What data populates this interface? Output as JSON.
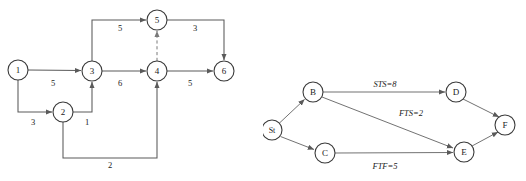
{
  "figures": [
    {
      "id": "activity-on-arrow-network",
      "name": "Activity-on-arrow network diagram",
      "nodes": [
        {
          "id": "n1",
          "label": "1",
          "cx": 18,
          "cy": 70,
          "r": 10
        },
        {
          "id": "n2",
          "label": "2",
          "cx": 63,
          "cy": 112,
          "r": 10
        },
        {
          "id": "n3",
          "label": "3",
          "cx": 92,
          "cy": 71,
          "r": 10
        },
        {
          "id": "n4",
          "label": "4",
          "cx": 157,
          "cy": 71,
          "r": 10
        },
        {
          "id": "n5",
          "label": "5",
          "cx": 157,
          "cy": 20,
          "r": 10
        },
        {
          "id": "n6",
          "label": "6",
          "cx": 224,
          "cy": 71,
          "r": 10
        }
      ],
      "edges": [
        {
          "from": "1",
          "to": "3",
          "weight": "5",
          "style": "solid",
          "label_x": 53,
          "label_y": 83
        },
        {
          "from": "1",
          "to": "2",
          "weight": "3",
          "style": "solid",
          "label_x": 33,
          "label_y": 122
        },
        {
          "from": "2",
          "to": "3",
          "weight": "1",
          "style": "solid",
          "label_x": 87,
          "label_y": 122
        },
        {
          "from": "3",
          "to": "4",
          "weight": "6",
          "style": "solid",
          "label_x": 120,
          "label_y": 83
        },
        {
          "from": "3",
          "to": "5",
          "weight": "5",
          "style": "solid",
          "label_x": 120,
          "label_y": 28
        },
        {
          "from": "2",
          "to": "4",
          "weight": "2",
          "style": "solid",
          "label_x": 110,
          "label_y": 165
        },
        {
          "from": "4",
          "to": "5",
          "weight": "",
          "style": "dashed",
          "label_x": 0,
          "label_y": 0
        },
        {
          "from": "4",
          "to": "6",
          "weight": "5",
          "style": "solid",
          "label_x": 190,
          "label_y": 83
        },
        {
          "from": "5",
          "to": "6",
          "weight": "3",
          "style": "solid",
          "label_x": 195,
          "label_y": 28
        }
      ]
    },
    {
      "id": "precedence-diagram-network",
      "name": "Precedence diagramming method network",
      "nodes": [
        {
          "id": "st",
          "label": "St",
          "cx": 272,
          "cy": 130,
          "r": 10
        },
        {
          "id": "b",
          "label": "B",
          "cx": 313,
          "cy": 92,
          "r": 10
        },
        {
          "id": "c",
          "label": "C",
          "cx": 325,
          "cy": 153,
          "r": 10
        },
        {
          "id": "d",
          "label": "D",
          "cx": 456,
          "cy": 92,
          "r": 10
        },
        {
          "id": "e",
          "label": "E",
          "cx": 464,
          "cy": 152,
          "r": 10
        },
        {
          "id": "f",
          "label": "F",
          "cx": 505,
          "cy": 125,
          "r": 10
        }
      ],
      "edges": [
        {
          "from": "St",
          "to": "B",
          "label": "",
          "label_x": 0,
          "label_y": 0
        },
        {
          "from": "St",
          "to": "C",
          "label": "",
          "label_x": 0,
          "label_y": 0
        },
        {
          "from": "B",
          "to": "D",
          "label": "STS=8",
          "label_x": 385,
          "label_y": 84
        },
        {
          "from": "B",
          "to": "E",
          "label": "FTS=2",
          "label_x": 411,
          "label_y": 113
        },
        {
          "from": "C",
          "to": "E",
          "label": "FTF=5",
          "label_x": 385,
          "label_y": 166
        },
        {
          "from": "D",
          "to": "F",
          "label": "",
          "label_x": 0,
          "label_y": 0
        },
        {
          "from": "E",
          "to": "F",
          "label": "",
          "label_x": 0,
          "label_y": 0
        }
      ]
    }
  ],
  "colors": {
    "background": "#ffffff",
    "node_stroke": "#3a3a3a",
    "edge_stroke": "#5a5a5a",
    "dashed_stroke": "#7a7a7a",
    "text": "#1a1a1a"
  }
}
